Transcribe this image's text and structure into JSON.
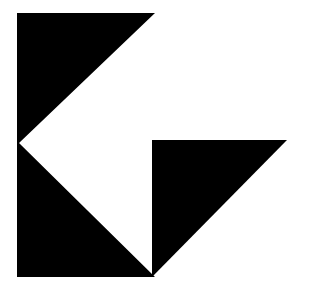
{
  "canvas": {
    "width": 309,
    "height": 291,
    "background_color": "#ffffff",
    "title": "Geometric Logo Mark"
  },
  "graphic": {
    "name": "abstract-geometric-logo",
    "description": "Black angular logo mark: a left-pointing chevron block beside a right triangle",
    "fill_color": "#000000",
    "stroke_color": "#000000",
    "shapes": [
      {
        "name": "chevron-block",
        "type": "polygon",
        "fill": "#000000",
        "points": "17,13 155,13 19,143 155,277 17,277"
      },
      {
        "name": "right-triangle",
        "type": "polygon",
        "fill": "#000000",
        "points": "152,140 287,140 152,277"
      }
    ]
  },
  "chart_data": {
    "type": "scatter",
    "xlabel": "",
    "ylabel": "",
    "xlim": [
      0,
      309
    ],
    "ylim": [
      0,
      291
    ],
    "grid": false,
    "legend": "none",
    "series": [
      {
        "name": "chevron-block",
        "x": [
          17,
          155,
          19,
          155,
          17
        ],
        "y": [
          13,
          13,
          143,
          277,
          277
        ]
      },
      {
        "name": "right-triangle",
        "x": [
          152,
          287,
          152
        ],
        "y": [
          140,
          140,
          277
        ]
      }
    ]
  }
}
